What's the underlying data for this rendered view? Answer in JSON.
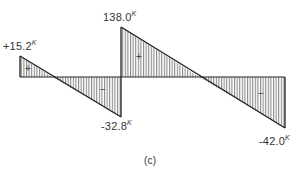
{
  "diagram": {
    "type": "shear-force-diagram",
    "caption": "(c)",
    "unit_suffix": "K",
    "baseline_y": 77,
    "segments": [
      {
        "name": "segment-1",
        "x_start": 20,
        "x_end": 121,
        "value_start": 15.2,
        "value_end": -32.8,
        "label_start": "+15.2",
        "label_end": "-32.8"
      },
      {
        "name": "segment-2",
        "x_start": 121,
        "x_end": 285,
        "value_start": 38.0,
        "value_end": -42.0,
        "label_start": "138.0",
        "label_end": "-42.0"
      }
    ],
    "region_signs": [
      {
        "sign": "+",
        "region": "positive-1"
      },
      {
        "sign": "−",
        "region": "negative-1"
      },
      {
        "sign": "+",
        "region": "positive-2"
      },
      {
        "sign": "−",
        "region": "negative-2"
      }
    ],
    "colors": {
      "outline": "#222222",
      "hatch": "#555555",
      "background": "#ffffff"
    }
  }
}
